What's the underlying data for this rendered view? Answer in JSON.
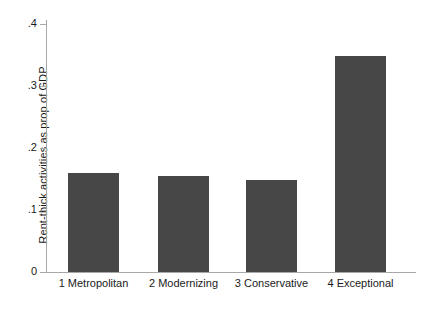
{
  "chart_data": {
    "type": "bar",
    "title": "",
    "subtitle": "",
    "xlabel": "",
    "ylabel": "Rent-thick activities as prop of GDP",
    "categories": [
      "1 Metropolitan",
      "2 Modernizing",
      "3 Conservative",
      "4 Exceptional"
    ],
    "values": [
      0.16,
      0.155,
      0.148,
      0.348
    ],
    "ylim": [
      0,
      0.4
    ],
    "ytick_labels": [
      "0",
      ".1",
      ".2",
      ".3",
      ".4"
    ],
    "ytick_values": [
      0,
      0.1,
      0.2,
      0.3,
      0.4
    ],
    "grid": false,
    "legend": null,
    "bar_color": "#474747",
    "axis_color": "#a8a8a8",
    "background": "#ffffff"
  },
  "axis": {
    "y_title": "Rent-thick activities as prop of GDP"
  }
}
